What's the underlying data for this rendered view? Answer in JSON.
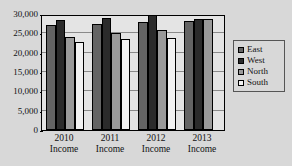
{
  "chart_data": {
    "type": "bar",
    "title": "",
    "xlabel": "",
    "ylabel": "",
    "categories": [
      "2010 Income",
      "2011 Income",
      "2012 Income",
      "2013 Income"
    ],
    "category_lines": [
      [
        "2010",
        "Income"
      ],
      [
        "2011",
        "Income"
      ],
      [
        "2012",
        "Income"
      ],
      [
        "2013",
        "Income"
      ]
    ],
    "series": [
      {
        "name": "East",
        "color": "#646464",
        "values": [
          27200,
          27500,
          28000,
          28300
        ]
      },
      {
        "name": "West",
        "color": "#2b2b2b",
        "values": [
          28500,
          29000,
          29800,
          28800
        ]
      },
      {
        "name": "North",
        "color": "#9a9a9a",
        "values": [
          24000,
          25000,
          25800,
          28800
        ]
      },
      {
        "name": "South",
        "color": "#f2f2f2",
        "values": [
          22800,
          23600,
          23800,
          0
        ]
      }
    ],
    "ylim": [
      0,
      30000
    ],
    "yticks": [
      0,
      5000,
      10000,
      15000,
      20000,
      25000,
      30000
    ],
    "ytick_labels": [
      "0",
      "5,000",
      "10,000",
      "15,000",
      "20,000",
      "25,000",
      "30,000"
    ],
    "grid": true,
    "legend_position": "right",
    "legend_entries": [
      "East",
      "West",
      "North",
      "South"
    ]
  },
  "colors": {
    "background": "#d8d8d8",
    "plot_background": "#e4e4e4",
    "axis": "#000000",
    "gridline": "#8a8a8a"
  }
}
